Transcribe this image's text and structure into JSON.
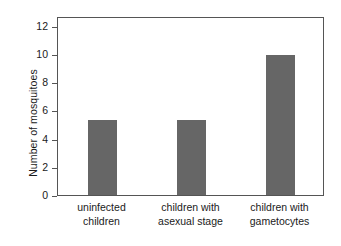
{
  "chart_data": {
    "type": "bar",
    "title": "",
    "xlabel": "",
    "ylabel": "Number of mosquitoes",
    "categories": [
      "uninfected children",
      "children with asexual stage",
      "children with gametocytes"
    ],
    "category_lines": [
      [
        "uninfected",
        "children"
      ],
      [
        "children with",
        "asexual stage"
      ],
      [
        "children with",
        "gametocytes"
      ]
    ],
    "values": [
      5.35,
      5.35,
      9.95
    ],
    "ylim": [
      0,
      12.7
    ],
    "yticks": [
      0,
      2,
      4,
      6,
      8,
      10,
      12
    ],
    "ytick_labels": [
      "0",
      "2",
      "4",
      "6",
      "8",
      "10",
      "12"
    ],
    "grid": false,
    "legend": false,
    "legend_position": "none",
    "bar_color": "#666666",
    "axis_color": "#555555",
    "background_color": "#ffffff",
    "text_color": "#1a1a1a"
  }
}
